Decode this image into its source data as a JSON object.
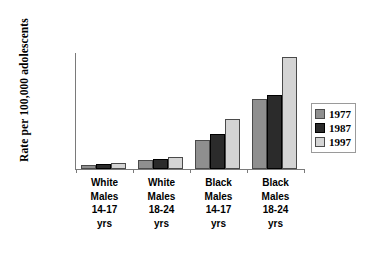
{
  "chart_data": {
    "type": "bar",
    "title": "",
    "xlabel": "",
    "ylabel": "Rate per 100,000 adolescents",
    "ylim": [
      0,
      250
    ],
    "yticks": [
      0,
      50,
      100,
      150,
      200,
      250
    ],
    "ytick_labels": [
      "0",
      "50",
      "100",
      "150",
      "200",
      "250"
    ],
    "grid": false,
    "legend_position": "right",
    "categories": [
      "White Males 14-17 yrs",
      "White Males 18-24 yrs",
      "Black Males 14-17 yrs",
      "Black Males 18-24 yrs"
    ],
    "category_lines": [
      [
        "White",
        "Males",
        "14-17",
        "yrs"
      ],
      [
        "White",
        "Males",
        "18-24",
        "yrs"
      ],
      [
        "Black",
        "Males",
        "14-17",
        "yrs"
      ],
      [
        "Black",
        "Males",
        "18-24",
        "yrs"
      ]
    ],
    "series": [
      {
        "name": "1977",
        "color": "#8f8f8f",
        "values": [
          9,
          20,
          64,
          152
        ]
      },
      {
        "name": "1987",
        "color": "#2b2b2b",
        "values": [
          11,
          22,
          77,
          160
        ]
      },
      {
        "name": "1997",
        "color": "#d4d4d4",
        "values": [
          14,
          27,
          108,
          243
        ]
      }
    ]
  },
  "legend": {
    "items": [
      {
        "label": "1977"
      },
      {
        "label": "1987"
      },
      {
        "label": "1997"
      }
    ]
  },
  "axis": {
    "y_title": "Rate per 100,000 adolescents"
  }
}
